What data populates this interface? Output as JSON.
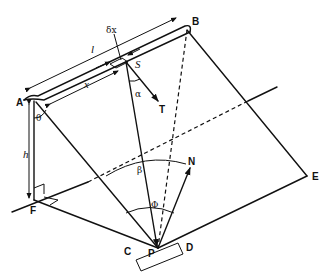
{
  "diagram": {
    "points": {
      "A": "A",
      "B": "B",
      "S": "S",
      "T": "T",
      "N": "N",
      "P": "P",
      "C": "C",
      "D": "D",
      "E": "E",
      "F": "F"
    },
    "quantities": {
      "length": "l",
      "distance": "x",
      "element": "δx",
      "height": "h"
    },
    "angles": {
      "theta": "θ",
      "alpha": "α",
      "beta": "β",
      "phi": "Φ"
    }
  }
}
